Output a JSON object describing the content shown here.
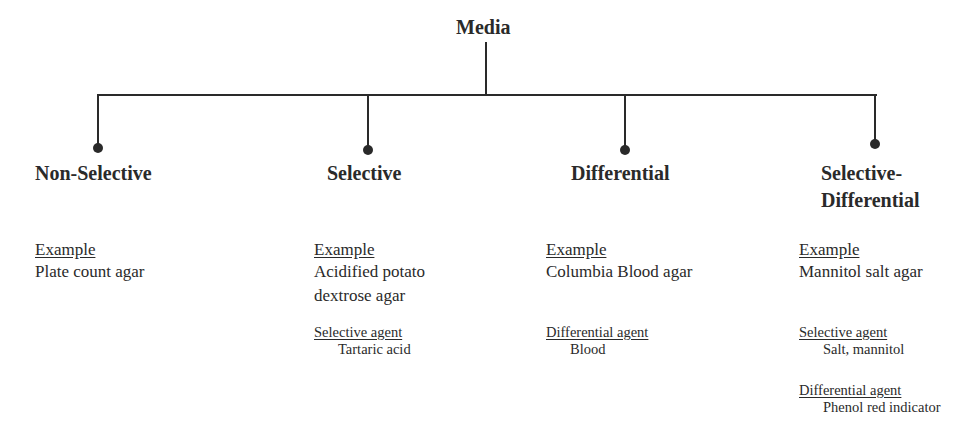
{
  "root": {
    "label": "Media"
  },
  "categories": [
    {
      "title": "Non-Selective",
      "example_label": "Example",
      "example": "Plate count agar"
    },
    {
      "title": "Selective",
      "example_label": "Example",
      "example_lines": [
        "Acidified potato",
        "dextrose agar"
      ],
      "agents": [
        {
          "label": "Selective agent",
          "value": "Tartaric acid"
        }
      ]
    },
    {
      "title": "Differential",
      "example_label": "Example",
      "example": "Columbia Blood agar",
      "agents": [
        {
          "label": "Differential agent",
          "value": "Blood"
        }
      ]
    },
    {
      "title_lines": [
        "Selective-",
        "Differential"
      ],
      "example_label": "Example",
      "example": "Mannitol salt agar",
      "agents": [
        {
          "label": "Selective agent",
          "value": "Salt, mannitol"
        },
        {
          "label": "Differential agent",
          "value": "Phenol red indicator"
        }
      ]
    }
  ]
}
